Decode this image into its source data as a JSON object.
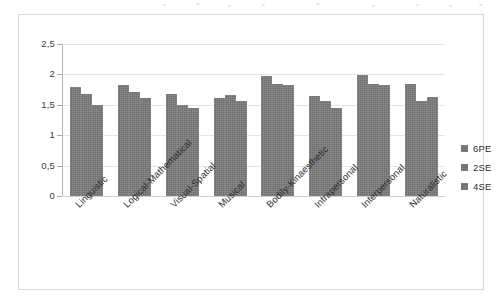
{
  "chart_data": {
    "type": "bar",
    "title": "",
    "subtitle": "",
    "xlabel": "",
    "ylabel": "",
    "ylim": [
      0,
      2.5
    ],
    "grid": true,
    "legend_position": "right",
    "y_ticks": [
      "0",
      "0,5",
      "1",
      "1,5",
      "2",
      "2,5"
    ],
    "y_tick_values": [
      0,
      0.5,
      1,
      1.5,
      2,
      2.5
    ],
    "categories": [
      "Linguistic",
      "Logical-Mathematical",
      "Visual-Spatial",
      "Musical",
      "Bodily-Kinaesthetic",
      "Intrapersonal",
      "Interpersonal",
      "Naturalistic"
    ],
    "series": [
      {
        "name": "6PE",
        "color": "#6e6e6e",
        "values": [
          1.79,
          1.82,
          1.67,
          1.62,
          1.97,
          1.64,
          1.99,
          1.84
        ]
      },
      {
        "name": "2SE",
        "color": "#6e6e6e",
        "values": [
          1.67,
          1.71,
          1.49,
          1.66,
          1.84,
          1.57,
          1.84,
          1.57
        ]
      },
      {
        "name": "4SE",
        "color": "#6e6e6e",
        "values": [
          1.49,
          1.61,
          1.44,
          1.57,
          1.82,
          1.44,
          1.82,
          1.63
        ]
      }
    ]
  },
  "legend": {
    "items": [
      {
        "label": "6PE"
      },
      {
        "label": "2SE"
      },
      {
        "label": "4SE"
      }
    ]
  },
  "colors": {
    "bar": "#6e6e6e",
    "gridline": "#e4e4e4",
    "axis": "#b5b5b5",
    "frame": "#d9d9d9",
    "text": "#2e2e2e"
  }
}
